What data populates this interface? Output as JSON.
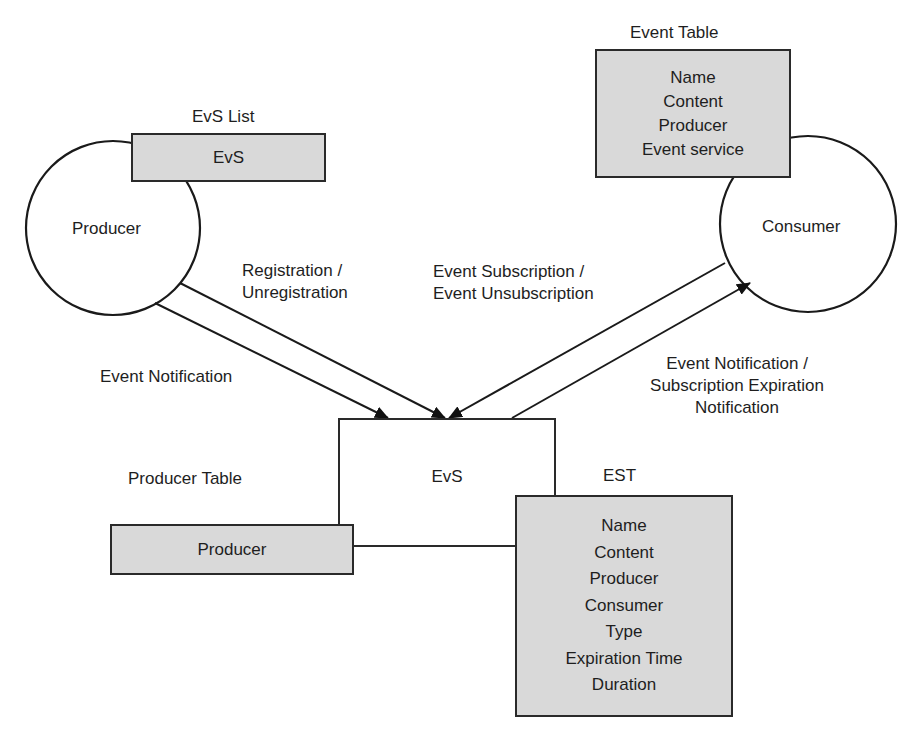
{
  "nodes": {
    "producer": {
      "label": "Producer"
    },
    "consumer": {
      "label": "Consumer"
    },
    "evs": {
      "label": "EvS"
    }
  },
  "tables": {
    "evs_list": {
      "title": "EvS List",
      "fields": [
        "EvS"
      ]
    },
    "event_table": {
      "title": "Event Table",
      "fields": [
        "Name",
        "Content",
        "Producer",
        "Event service"
      ]
    },
    "producer_table": {
      "title": "Producer Table",
      "fields": [
        "Producer"
      ]
    },
    "est": {
      "title": "EST",
      "fields": [
        "Name",
        "Content",
        "Producer",
        "Consumer",
        "Type",
        "Expiration Time",
        "Duration"
      ]
    }
  },
  "edges": {
    "registration": {
      "line1": "Registration /",
      "line2": "Unregistration"
    },
    "producer_notification": {
      "line1": "Event Notification"
    },
    "subscription": {
      "line1": "Event Subscription /",
      "line2": "Event Unsubscription"
    },
    "consumer_notification": {
      "line1": "Event Notification /",
      "line2": "Subscription Expiration",
      "line3": "Notification"
    }
  },
  "colors": {
    "table_fill": "#d9d9d9",
    "stroke": "#1a1a1a",
    "background": "#ffffff"
  }
}
